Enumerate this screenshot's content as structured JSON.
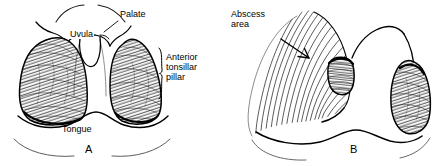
{
  "figure": {
    "background_color": "#ffffff",
    "ink_color": "#000000",
    "style": "black-and-white pen-and-ink line drawing with hatched shading"
  },
  "panels": [
    {
      "id": "A",
      "letter": "A",
      "caption": "Normal oropharynx",
      "labels": [
        {
          "name": "palate",
          "text": "Palate",
          "x": 121,
          "y": 13,
          "leader": "line-down-left"
        },
        {
          "name": "uvula",
          "text": "Uvula",
          "x": 70,
          "y": 33,
          "leader": "inline"
        },
        {
          "name": "anterior-tonsillar-pillar",
          "text": "Anterior\ntonsillar\npillar",
          "x": 165,
          "y": 56,
          "leader": "brace"
        },
        {
          "name": "tongue",
          "text": "Tongue",
          "x": 62,
          "y": 126,
          "leader": "none"
        }
      ]
    },
    {
      "id": "B",
      "letter": "B",
      "caption": "Peritonsillar abscess with uvular deviation",
      "labels": [
        {
          "name": "abscess-area",
          "text": "Abscess\narea",
          "x": 231,
          "y": 12,
          "leader": "arrow"
        }
      ]
    }
  ],
  "label_text": {
    "palate": "Palate",
    "uvula": "Uvula",
    "anterior_line1": "Anterior",
    "anterior_line2": "tonsillar",
    "anterior_line3": "pillar",
    "tongue": "Tongue",
    "abscess_line1": "Abscess",
    "abscess_line2": "area",
    "panel_a": "A",
    "panel_b": "B"
  },
  "colors": {
    "ink": "#000000",
    "background": "#ffffff",
    "hatch": "#1a1a1a"
  }
}
